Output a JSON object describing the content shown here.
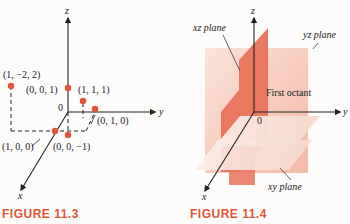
{
  "figure_11_3": {
    "caption": "FIGURE 11.3",
    "axes": {
      "x": "x",
      "y": "y",
      "z": "z",
      "origin": "0"
    },
    "points": [
      {
        "label": "(1, −2, 2)"
      },
      {
        "label": "(0, 0, 1)"
      },
      {
        "label": "(1, 1, 1)"
      },
      {
        "label": "(0, 1, 0)"
      },
      {
        "label": "(1, 0, 0)"
      },
      {
        "label": "(0, 0, −1)"
      }
    ]
  },
  "figure_11_4": {
    "caption": "FIGURE 11.4",
    "axes": {
      "x": "x",
      "y": "y",
      "z": "z",
      "origin": "0"
    },
    "labels": {
      "xz_plane": "xz plane",
      "yz_plane": "yz plane",
      "xy_plane": "xy plane",
      "first_octant": "First octant"
    }
  },
  "colors": {
    "point": "#e0553a",
    "caption": "#e0553a",
    "plane_dark": "#e8735a",
    "plane_light": "#f6d3c6"
  }
}
